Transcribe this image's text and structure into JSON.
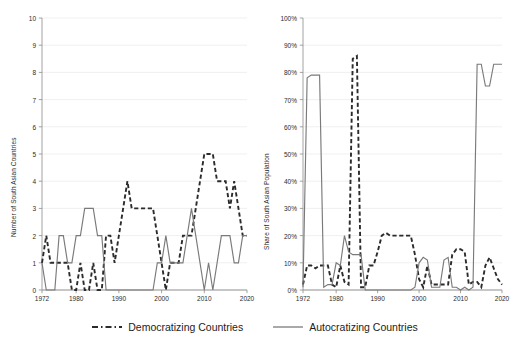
{
  "legend": {
    "items": [
      {
        "label": "Democratizing Countries",
        "style": "dashed",
        "color": "#2b2b2b",
        "name": "democratizing"
      },
      {
        "label": "Autocratizing Countries",
        "style": "solid",
        "color": "#7a7a7a",
        "name": "autocratizing"
      }
    ]
  },
  "chart_data": [
    {
      "type": "line",
      "panel": "left",
      "title": "",
      "xlabel": "",
      "ylabel": "Number of South Asian Countries",
      "xlim": [
        1972,
        2020
      ],
      "ylim": [
        0,
        10
      ],
      "yticks": [
        0,
        1,
        2,
        3,
        4,
        5,
        6,
        7,
        8,
        9,
        10
      ],
      "ytick_labels": [
        "0",
        "1",
        "2",
        "3",
        "4",
        "5",
        "6",
        "7",
        "8",
        "9",
        "10"
      ],
      "xticks": [
        1972,
        1980,
        1990,
        2000,
        2010,
        2020
      ],
      "xtick_labels": [
        "1972",
        "1980",
        "1990",
        "2000",
        "2010",
        "2020"
      ],
      "grid": true,
      "legend_position": "below-figure",
      "x": [
        1972,
        1973,
        1974,
        1975,
        1976,
        1977,
        1978,
        1979,
        1980,
        1981,
        1982,
        1983,
        1984,
        1985,
        1986,
        1987,
        1988,
        1989,
        1990,
        1991,
        1992,
        1993,
        1994,
        1995,
        1996,
        1997,
        1998,
        1999,
        2000,
        2001,
        2002,
        2003,
        2004,
        2005,
        2006,
        2007,
        2008,
        2009,
        2010,
        2011,
        2012,
        2013,
        2014,
        2015,
        2016,
        2017,
        2018,
        2019,
        2020
      ],
      "series": [
        {
          "name": "Democratizing Countries",
          "style": "dashed",
          "color": "#2b2b2b",
          "values": [
            1,
            2,
            1,
            1,
            1,
            1,
            1,
            0,
            0,
            1,
            0,
            0,
            1,
            0,
            0,
            2,
            2,
            1,
            2,
            3,
            4,
            3,
            3,
            3,
            3,
            3,
            3,
            2,
            1,
            0,
            1,
            1,
            1,
            2,
            2,
            2,
            3,
            4,
            5,
            5,
            5,
            4,
            4,
            4,
            3,
            4,
            3,
            2,
            2
          ]
        },
        {
          "name": "Autocratizing Countries",
          "style": "solid",
          "color": "#7a7a7a",
          "values": [
            1,
            0,
            0,
            0,
            2,
            2,
            1,
            1,
            2,
            2,
            3,
            3,
            3,
            2,
            2,
            0,
            0,
            0,
            0,
            0,
            0,
            0,
            0,
            0,
            0,
            0,
            0,
            1,
            1,
            2,
            1,
            1,
            1,
            1,
            2,
            3,
            2,
            1,
            0,
            1,
            0,
            1,
            2,
            2,
            2,
            1,
            1,
            2,
            2
          ]
        }
      ]
    },
    {
      "type": "line",
      "panel": "right",
      "title": "",
      "xlabel": "",
      "ylabel": "Share of South Asian Population",
      "xlim": [
        1972,
        2020
      ],
      "ylim": [
        0,
        100
      ],
      "yticks": [
        0,
        10,
        20,
        30,
        40,
        50,
        60,
        70,
        80,
        90,
        100
      ],
      "ytick_labels": [
        "0%",
        "10%",
        "20%",
        "30%",
        "40%",
        "50%",
        "60%",
        "70%",
        "80%",
        "90%",
        "100%"
      ],
      "xticks": [
        1972,
        1980,
        1990,
        2000,
        2010,
        2020
      ],
      "xtick_labels": [
        "1972",
        "1980",
        "1990",
        "2000",
        "2010",
        "2020"
      ],
      "grid": true,
      "legend_position": "below-figure",
      "x": [
        1972,
        1973,
        1974,
        1975,
        1976,
        1977,
        1978,
        1979,
        1980,
        1981,
        1982,
        1983,
        1984,
        1985,
        1986,
        1987,
        1988,
        1989,
        1990,
        1991,
        1992,
        1993,
        1994,
        1995,
        1996,
        1997,
        1998,
        1999,
        2000,
        2001,
        2002,
        2003,
        2004,
        2005,
        2006,
        2007,
        2008,
        2009,
        2010,
        2011,
        2012,
        2013,
        2014,
        2015,
        2016,
        2017,
        2018,
        2019,
        2020
      ],
      "series": [
        {
          "name": "Democratizing Countries",
          "style": "dashed",
          "color": "#2b2b2b",
          "values": [
            2,
            9,
            9,
            8,
            9,
            9,
            9,
            2,
            1,
            9,
            3,
            2,
            85,
            86,
            1,
            1,
            9,
            9,
            14,
            20,
            21,
            20,
            20,
            20,
            20,
            20,
            20,
            13,
            4,
            1,
            9,
            2,
            2,
            2,
            2,
            2,
            13,
            15,
            15,
            14,
            2,
            3,
            3,
            1,
            9,
            12,
            8,
            4,
            2
          ]
        },
        {
          "name": "Autocratizing Countries",
          "style": "solid",
          "color": "#7a7a7a",
          "values": [
            1,
            78,
            79,
            79,
            79,
            1,
            2,
            2,
            10,
            9,
            20,
            14,
            13,
            13,
            13,
            0,
            0,
            0,
            0,
            0,
            0,
            0,
            0,
            0,
            0,
            0,
            0,
            1,
            10,
            12,
            11,
            1,
            1,
            1,
            11,
            12,
            1,
            1,
            0,
            1,
            0,
            1,
            83,
            83,
            75,
            75,
            83,
            83,
            83
          ]
        }
      ]
    }
  ]
}
